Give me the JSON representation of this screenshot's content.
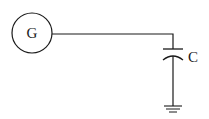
{
  "diagram": {
    "type": "circuit",
    "components": [
      {
        "id": "generator",
        "symbol": "circle",
        "label": "G"
      },
      {
        "id": "capacitor",
        "symbol": "capacitor",
        "label": "C"
      },
      {
        "id": "ground",
        "symbol": "ground"
      }
    ],
    "connections": [
      {
        "from": "generator",
        "to": "capacitor"
      },
      {
        "from": "capacitor",
        "to": "ground"
      }
    ],
    "stroke_color": "#1a1a1a",
    "background": "#ffffff"
  }
}
